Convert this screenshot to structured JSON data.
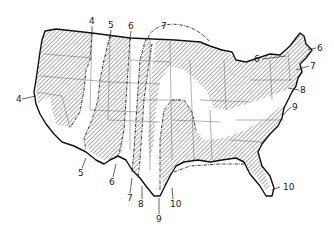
{
  "map": {
    "title": "",
    "subject": "Contiguous United States zone map",
    "style": "black-and-white line drawing with diagonal hatching on alternating zones",
    "colors": {
      "background": "#ffffff",
      "ink": "#111111",
      "hatch": "#444444"
    },
    "zone_labels": [
      {
        "id": "z4-west",
        "text": "4",
        "x": 16,
        "y": 102
      },
      {
        "id": "z4-north",
        "text": "4",
        "x": 91,
        "y": 24
      },
      {
        "id": "z5-north",
        "text": "5",
        "x": 110,
        "y": 28
      },
      {
        "id": "z6-north",
        "text": "6",
        "x": 130,
        "y": 29
      },
      {
        "id": "z7-north",
        "text": "7",
        "x": 163,
        "y": 29
      },
      {
        "id": "z5-south",
        "text": "5",
        "x": 80,
        "y": 176
      },
      {
        "id": "z6-south",
        "text": "6",
        "x": 111,
        "y": 185
      },
      {
        "id": "z7-south",
        "text": "7",
        "x": 129,
        "y": 201
      },
      {
        "id": "z8-south",
        "text": "8",
        "x": 140,
        "y": 207
      },
      {
        "id": "z9-south",
        "text": "9",
        "x": 158,
        "y": 222
      },
      {
        "id": "z10-gulf",
        "text": "10",
        "x": 172,
        "y": 207
      },
      {
        "id": "z10-florida",
        "text": "10",
        "x": 283,
        "y": 190
      },
      {
        "id": "z6-ne-left",
        "text": "6",
        "x": 256,
        "y": 62
      },
      {
        "id": "z6-ne-right",
        "text": "6",
        "x": 319,
        "y": 51
      },
      {
        "id": "z7-ne",
        "text": "7",
        "x": 312,
        "y": 69
      },
      {
        "id": "z8-ne",
        "text": "8",
        "x": 302,
        "y": 93
      },
      {
        "id": "z9-ne",
        "text": "9",
        "x": 294,
        "y": 110
      }
    ]
  }
}
